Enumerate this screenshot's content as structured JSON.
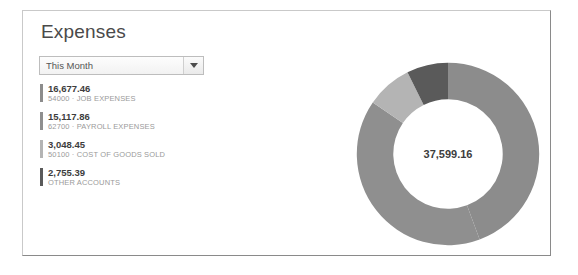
{
  "panel": {
    "title": "Expenses"
  },
  "period_filter": {
    "value": "This Month",
    "placeholder": "This Month",
    "arrow_icon": "chevron-down-icon",
    "options": [
      "This Month"
    ]
  },
  "legend": [
    {
      "amount": "16,677.46",
      "account": "54000 · JOB EXPENSES",
      "color": "#8c8c8c",
      "value": 16677.46
    },
    {
      "amount": "15,117.86",
      "account": "62700 · PAYROLL EXPENSES",
      "color": "#8f8f8f",
      "value": 15117.86
    },
    {
      "amount": "3,048.45",
      "account": "50100 · COST OF GOODS SOLD",
      "color": "#b4b4b4",
      "value": 3048.45
    },
    {
      "amount": "2,755.39",
      "account": "OTHER ACCOUNTS",
      "color": "#5a5a5a",
      "value": 2755.39
    }
  ],
  "donut": {
    "total_label": "37,599.16",
    "total_value": 37599.16
  },
  "chart_data": {
    "type": "pie",
    "title": "Expenses",
    "subtitle": "This Month",
    "categories": [
      "54000 · JOB EXPENSES",
      "62700 · PAYROLL EXPENSES",
      "50100 · COST OF GOODS SOLD",
      "OTHER ACCOUNTS"
    ],
    "values": [
      16677.46,
      15117.86,
      3048.45,
      2755.39
    ],
    "value_labels": [
      "16,677.46",
      "15,117.86",
      "3,048.45",
      "2,755.39"
    ],
    "colors": [
      "#8c8c8c",
      "#8f8f8f",
      "#b4b4b4",
      "#5a5a5a"
    ],
    "percentages": [
      44.4,
      40.2,
      8.1,
      7.3
    ],
    "center_label": "37,599.16",
    "center_value": 37599.16,
    "donut": true,
    "inner_radius_ratio": 0.6,
    "start_angle_deg": 0,
    "direction": "clockwise",
    "legend_position": "left",
    "grid": false
  }
}
